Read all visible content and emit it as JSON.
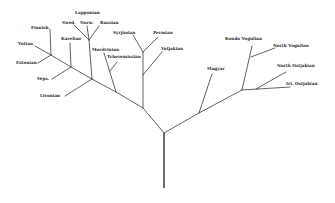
{
  "diagram": {
    "type": "language-family-tree",
    "root": "Finno-Ugric",
    "groups": {
      "baltic_finnic": [
        "Finnish",
        "Votian",
        "Estonian",
        "Karelian",
        "Vepsian",
        "Livonian"
      ],
      "lapp": [
        "Lappontan",
        "Swed.",
        "Norw.",
        "Russian"
      ],
      "volga": [
        "Mordvinian",
        "Tcheremissian"
      ],
      "permic": [
        "Syrjänian",
        "Permian",
        "Votjakian"
      ],
      "ugric": [
        "Magyar",
        "Konda Vogulian",
        "North Vogulian",
        "North Ostjakian",
        "Irt. Ostjakian"
      ]
    },
    "labels": {
      "finnish": "Finnish",
      "votian": "Votian",
      "estonian": "Estonian",
      "karelian": "Karelian",
      "veps": "Veps.",
      "livonian": "Livonian",
      "lappontan": "Lapponian",
      "swed": "Swed.",
      "norw": "Norw.",
      "russian": "Russian",
      "mordvinian": "Mordvinian",
      "tcheremissian": "Tcheremissian",
      "syrjanian": "Syrjänian",
      "permian": "Permian",
      "votjakian": "Votjakian",
      "magyar": "Magyar",
      "konda_vogulian": "Konda Vogulian",
      "north_vogulian": "North Vogulian",
      "north_ostjakian": "North Ostjakian",
      "irt_ostjakian": "Irt. Ostjakian"
    }
  }
}
